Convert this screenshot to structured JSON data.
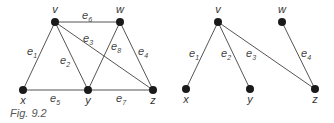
{
  "caption": "Fig. 9.2",
  "graphs": [
    {
      "name": "graph-G",
      "vertices": [
        {
          "id": "v",
          "label": "v",
          "x": 55,
          "y": 22
        },
        {
          "id": "w",
          "label": "w",
          "x": 120,
          "y": 22
        },
        {
          "id": "x",
          "label": "x",
          "x": 23,
          "y": 90
        },
        {
          "id": "y",
          "label": "y",
          "x": 88,
          "y": 90
        },
        {
          "id": "z",
          "label": "z",
          "x": 153,
          "y": 90
        }
      ],
      "edges": [
        {
          "id": "e1",
          "label": "e",
          "sub": "1",
          "from": "v",
          "to": "x"
        },
        {
          "id": "e2",
          "label": "e",
          "sub": "2",
          "from": "v",
          "to": "y"
        },
        {
          "id": "e3",
          "label": "e",
          "sub": "3",
          "from": "v",
          "to": "z"
        },
        {
          "id": "e4",
          "label": "e",
          "sub": "4",
          "from": "w",
          "to": "z"
        },
        {
          "id": "e5",
          "label": "e",
          "sub": "5",
          "from": "x",
          "to": "y"
        },
        {
          "id": "e6",
          "label": "e",
          "sub": "6",
          "from": "v",
          "to": "w"
        },
        {
          "id": "e7",
          "label": "e",
          "sub": "7",
          "from": "y",
          "to": "z"
        },
        {
          "id": "e8",
          "label": "e",
          "sub": "8",
          "from": "w",
          "to": "y"
        }
      ]
    },
    {
      "name": "spanning-tree-T",
      "vertices": [
        {
          "id": "v",
          "label": "v",
          "x": 218,
          "y": 22
        },
        {
          "id": "w",
          "label": "w",
          "x": 282,
          "y": 22
        },
        {
          "id": "x",
          "label": "x",
          "x": 186,
          "y": 89
        },
        {
          "id": "y",
          "label": "y",
          "x": 250,
          "y": 89
        },
        {
          "id": "z",
          "label": "z",
          "x": 315,
          "y": 89
        }
      ],
      "edges": [
        {
          "id": "e1",
          "label": "e",
          "sub": "1",
          "from": "v",
          "to": "x"
        },
        {
          "id": "e2",
          "label": "e",
          "sub": "2",
          "from": "v",
          "to": "y"
        },
        {
          "id": "e3",
          "label": "e",
          "sub": "3",
          "from": "v",
          "to": "z"
        },
        {
          "id": "e4",
          "label": "e",
          "sub": "4",
          "from": "w",
          "to": "z"
        }
      ]
    }
  ]
}
